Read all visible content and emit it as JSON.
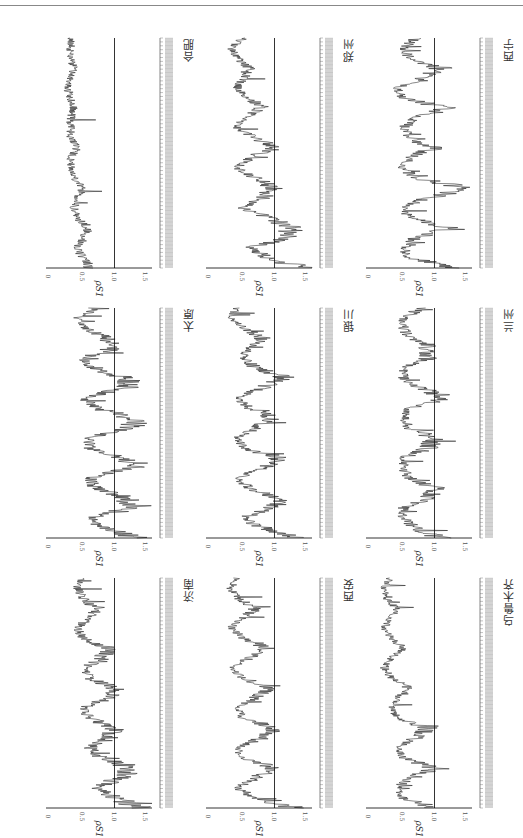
{
  "page": {
    "orientation": "rotated-90"
  },
  "chart_data": [
    {
      "type": "line",
      "title": "西宁",
      "ylabel": "ρS1",
      "ylim": [
        0,
        1.6
      ],
      "yticks": [
        0,
        0.5,
        1.0,
        1.5
      ],
      "reference_line": 1.0,
      "shape": [
        1.4,
        0.6,
        0.5,
        0.7,
        1.3,
        0.6,
        0.5,
        0.9,
        1.5,
        0.7,
        0.5,
        0.6,
        1.0,
        0.6,
        0.5,
        0.7,
        1.2,
        0.5,
        0.4,
        0.8,
        1.1,
        0.6,
        0.5,
        0.7
      ]
    },
    {
      "type": "line",
      "title": "兰州",
      "ylabel": "ρS1",
      "ylim": [
        0,
        1.6
      ],
      "yticks": [
        0,
        0.5,
        1.0,
        1.5
      ],
      "reference_line": 1.0,
      "shape": [
        1.1,
        0.7,
        0.5,
        0.5,
        0.9,
        1.0,
        0.6,
        0.5,
        0.5,
        0.9,
        1.0,
        0.6,
        0.5,
        0.6,
        1.2,
        0.8,
        0.5,
        0.5,
        0.9,
        0.9,
        0.6,
        0.5,
        0.5,
        0.8
      ]
    },
    {
      "type": "line",
      "title": "乌鲁木齐",
      "ylabel": "ρS1",
      "ylim": [
        0,
        1.6
      ],
      "yticks": [
        0,
        0.5,
        1.0,
        1.5
      ],
      "reference_line": 1.0,
      "shape": [
        1.0,
        0.5,
        0.4,
        0.6,
        1.0,
        0.5,
        0.4,
        0.7,
        0.9,
        0.4,
        0.3,
        0.4,
        0.6,
        0.3,
        0.2,
        0.3,
        0.5,
        0.3,
        0.2,
        0.3,
        0.4,
        0.2,
        0.2,
        0.3
      ]
    },
    {
      "type": "line",
      "title": "郑州",
      "ylabel": "ρS1",
      "ylim": [
        0,
        1.6
      ],
      "yticks": [
        0,
        0.5,
        1.0,
        1.5
      ],
      "reference_line": 1.0,
      "shape": [
        1.5,
        0.9,
        0.6,
        1.2,
        1.3,
        0.9,
        0.5,
        0.8,
        1.0,
        0.7,
        0.4,
        0.6,
        1.0,
        0.7,
        0.4,
        0.5,
        0.8,
        0.6,
        0.4,
        0.5,
        0.6,
        0.4,
        0.3,
        0.5
      ]
    },
    {
      "type": "line",
      "title": "银川",
      "ylabel": "ρS1",
      "ylim": [
        0,
        1.6
      ],
      "yticks": [
        0,
        0.5,
        1.0,
        1.5
      ],
      "reference_line": 1.0,
      "shape": [
        1.4,
        0.8,
        0.5,
        0.9,
        1.1,
        0.6,
        0.4,
        0.8,
        1.1,
        0.5,
        0.4,
        0.7,
        1.0,
        0.6,
        0.4,
        0.8,
        1.2,
        0.7,
        0.5,
        0.6,
        0.8,
        0.5,
        0.3,
        0.4
      ]
    },
    {
      "type": "line",
      "title": "西安",
      "ylabel": "ρS1",
      "ylim": [
        0,
        1.6
      ],
      "yticks": [
        0,
        0.5,
        1.0,
        1.5
      ],
      "reference_line": 1.0,
      "shape": [
        1.3,
        0.7,
        0.4,
        0.7,
        1.0,
        0.5,
        0.4,
        0.8,
        1.0,
        0.5,
        0.4,
        0.7,
        0.9,
        0.5,
        0.3,
        0.6,
        0.9,
        0.5,
        0.3,
        0.5,
        0.7,
        0.4,
        0.3,
        0.4
      ]
    },
    {
      "type": "line",
      "title": "合肥",
      "ylabel": "ρS1",
      "ylim": [
        0,
        1.6
      ],
      "yticks": [
        0,
        0.5,
        1.0,
        1.5
      ],
      "reference_line": 1.0,
      "shape": [
        0.6,
        0.5,
        0.4,
        0.5,
        0.6,
        0.4,
        0.35,
        0.4,
        0.5,
        0.35,
        0.3,
        0.3,
        0.4,
        0.3,
        0.3,
        0.3,
        0.35,
        0.3,
        0.25,
        0.3,
        0.35,
        0.3,
        0.3,
        0.3
      ]
    },
    {
      "type": "line",
      "title": "太原",
      "ylabel": "ρS1",
      "ylim": [
        0,
        1.6
      ],
      "yticks": [
        0,
        0.5,
        1.0,
        1.5
      ],
      "reference_line": 1.0,
      "shape": [
        1.4,
        0.8,
        0.6,
        1.3,
        1.2,
        0.7,
        0.6,
        1.3,
        1.1,
        0.6,
        0.6,
        1.3,
        1.3,
        0.7,
        0.5,
        1.2,
        1.2,
        0.6,
        0.5,
        1.0,
        0.9,
        0.5,
        0.4,
        0.7
      ]
    },
    {
      "type": "line",
      "title": "济南",
      "ylabel": "ρS1",
      "ylim": [
        0,
        1.6
      ],
      "yticks": [
        0,
        0.5,
        1.0,
        1.5
      ],
      "reference_line": 1.0,
      "shape": [
        1.4,
        1.0,
        0.7,
        1.1,
        1.3,
        0.8,
        0.6,
        0.9,
        1.0,
        0.6,
        0.5,
        0.9,
        1.0,
        0.6,
        0.5,
        0.8,
        0.9,
        0.5,
        0.4,
        0.6,
        0.7,
        0.5,
        0.4,
        0.5
      ]
    }
  ],
  "axis": {
    "ylabel": "ρS1",
    "ticks": [
      "1.5",
      "1.0",
      "0.5",
      "0"
    ]
  }
}
